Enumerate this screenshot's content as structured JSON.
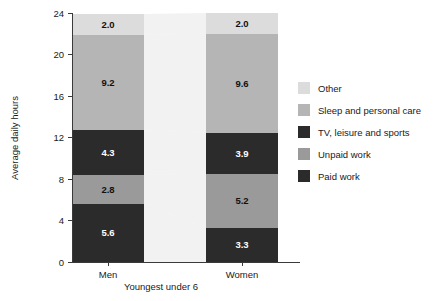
{
  "chart_data": {
    "type": "bar",
    "subtype": "stacked",
    "title": "",
    "xlabel": "Youngest under 6",
    "ylabel": "Average daily hours",
    "ylim": [
      0,
      24
    ],
    "yticks": [
      0,
      4,
      8,
      12,
      16,
      20,
      24
    ],
    "ytick_labels": [
      "0",
      "4",
      "8",
      "12",
      "16",
      "20",
      "24"
    ],
    "grid": false,
    "legend_position": "right",
    "categories": [
      "Men",
      "Women"
    ],
    "series": [
      {
        "name": "Paid work",
        "values": [
          5.6,
          3.3
        ],
        "color": "#2b2b2b",
        "label_color": "on-dark"
      },
      {
        "name": "Unpaid work",
        "values": [
          2.8,
          5.2
        ],
        "color": "#9a9a9a",
        "label_color": "on-light"
      },
      {
        "name": "TV, leisure and sports",
        "values": [
          4.3,
          3.9
        ],
        "color": "#2b2b2b",
        "label_color": "on-dark"
      },
      {
        "name": "Sleep and personal care",
        "values": [
          9.2,
          9.6
        ],
        "color": "#b5b5b5",
        "label_color": "on-light"
      },
      {
        "name": "Other",
        "values": [
          2.0,
          2.0
        ],
        "color": "#dcdcdc",
        "label_color": "on-light"
      }
    ],
    "value_labels": {
      "Men": [
        "5.6",
        "2.8",
        "4.3",
        "9.2",
        "2.0"
      ],
      "Women": [
        "3.3",
        "5.2",
        "3.9",
        "9.6",
        "2.0"
      ]
    },
    "legend_entries": [
      {
        "label": "Other",
        "color": "#dcdcdc"
      },
      {
        "label": "Sleep and personal care",
        "color": "#b5b5b5"
      },
      {
        "label": "TV, leisure and sports",
        "color": "#2b2b2b"
      },
      {
        "label": "Unpaid work",
        "color": "#9a9a9a"
      },
      {
        "label": "Paid work",
        "color": "#2b2b2b"
      }
    ]
  },
  "axes": {
    "y_title": "Average daily hours",
    "x_caption": "Youngest under 6"
  },
  "colors": {
    "axis": "#3a3a3a",
    "text": "#1a1a1a",
    "background": "#ffffff",
    "ribbon": "#e8e8e8"
  }
}
